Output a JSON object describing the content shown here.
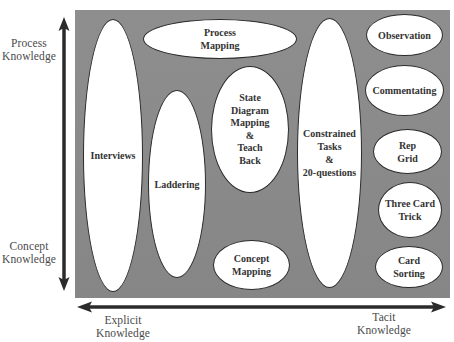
{
  "diagram": {
    "type": "knowledge-elicitation-techniques-map",
    "axes": {
      "vertical": {
        "top_label": "Process\nKnowledge",
        "bottom_label": "Concept\nKnowledge"
      },
      "horizontal": {
        "left_label": "Explicit\nKnowledge",
        "right_label": "Tacit\nKnowledge"
      }
    },
    "colors": {
      "panel": "#8a8a8a",
      "node_fill": "#ffffff",
      "node_border": "#2a2a2a",
      "arrow": "#2b2b2b",
      "text": "#333333"
    },
    "nodes": [
      {
        "id": "interviews",
        "label": "Interviews"
      },
      {
        "id": "process-mapping",
        "label": "Process\nMapping"
      },
      {
        "id": "laddering",
        "label": "Laddering"
      },
      {
        "id": "state-diagram",
        "label": "State\nDiagram\nMapping\n&\nTeach\nBack"
      },
      {
        "id": "concept-mapping",
        "label": "Concept\nMapping"
      },
      {
        "id": "constrained-tasks",
        "label": "Constrained\nTasks\n&\n20-questions"
      },
      {
        "id": "observation",
        "label": "Observation"
      },
      {
        "id": "commentating",
        "label": "Commentating"
      },
      {
        "id": "rep-grid",
        "label": "Rep\nGrid"
      },
      {
        "id": "three-card-trick",
        "label": "Three Card\nTrick"
      },
      {
        "id": "card-sorting",
        "label": "Card\nSorting"
      }
    ]
  }
}
